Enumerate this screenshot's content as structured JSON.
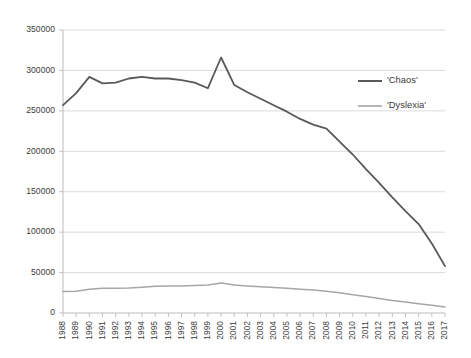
{
  "chart_data": {
    "type": "line",
    "title": "",
    "xlabel": "",
    "ylabel": "",
    "ylim": [
      0,
      350000
    ],
    "grid": true,
    "legend_position": "right-top",
    "yticks": [
      "0",
      "50000",
      "100000",
      "150000",
      "200000",
      "250000",
      "300000",
      "350000"
    ],
    "ytick_values": [
      0,
      50000,
      100000,
      150000,
      200000,
      250000,
      300000,
      350000
    ],
    "categories": [
      "1988",
      "1989",
      "1990",
      "1991",
      "1992",
      "1993",
      "1994",
      "1995",
      "1996",
      "1997",
      "1998",
      "1999",
      "2000",
      "2001",
      "2002",
      "2003",
      "2004",
      "2005",
      "2006",
      "2007",
      "2008",
      "2009",
      "2010",
      "2011",
      "2012",
      "2013",
      "2014",
      "2015",
      "2016",
      "2017"
    ],
    "series": [
      {
        "name": "'Chaos'",
        "color": "#595959",
        "width": 1.8,
        "values": [
          257000,
          272000,
          292000,
          284000,
          285000,
          290000,
          292000,
          290000,
          290000,
          288000,
          285000,
          278000,
          316000,
          282000,
          273000,
          265000,
          257000,
          249000,
          240000,
          233000,
          228000,
          212000,
          196000,
          178000,
          161000,
          143000,
          126000,
          110000,
          86000,
          58000
        ]
      },
      {
        "name": "'Dyslexia'",
        "color": "#a6a6a6",
        "width": 1.5,
        "values": [
          26500,
          27000,
          29500,
          30500,
          30500,
          31000,
          32000,
          33000,
          33500,
          33500,
          34000,
          34500,
          37000,
          34500,
          33500,
          32500,
          31500,
          30500,
          29500,
          28500,
          27000,
          25000,
          22500,
          20500,
          18000,
          15500,
          13500,
          11500,
          9500,
          7500
        ]
      }
    ]
  },
  "legend": {
    "items": [
      {
        "label": "'Chaos'",
        "color": "#595959"
      },
      {
        "label": "'Dyslexia'",
        "color": "#a6a6a6"
      }
    ]
  }
}
